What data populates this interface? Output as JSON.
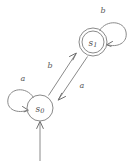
{
  "diagram": {
    "type": "finite-state-automaton",
    "title": "",
    "background_color": "#ffffff",
    "stroke_color": "#8a8a8a",
    "text_color": "#4a4a4a",
    "alphabet": [
      "a",
      "b"
    ],
    "states": [
      {
        "id": "s0",
        "label_base": "s",
        "label_sub": "0",
        "accepting": false,
        "initial": true,
        "cx": 40,
        "cy": 108,
        "r": 13
      },
      {
        "id": "s1",
        "label_base": "s",
        "label_sub": "1",
        "accepting": true,
        "initial": false,
        "cx": 93,
        "cy": 42,
        "r_outer": 14,
        "r_inner": 11
      }
    ],
    "transitions": [
      {
        "id": "t-s0-self",
        "from": "s0",
        "to": "s0",
        "symbol": "a",
        "kind": "self-loop",
        "label_x": 23,
        "label_y": 78
      },
      {
        "id": "t-s0-s1",
        "from": "s0",
        "to": "s1",
        "symbol": "b",
        "kind": "edge",
        "label_x": 50,
        "label_y": 65
      },
      {
        "id": "t-s1-s0",
        "from": "s1",
        "to": "s0",
        "symbol": "a",
        "kind": "edge",
        "label_x": 82,
        "label_y": 85
      },
      {
        "id": "t-s1-self",
        "from": "s1",
        "to": "s1",
        "symbol": "b",
        "kind": "self-loop",
        "label_x": 103,
        "label_y": 10
      }
    ],
    "start_arrow": {
      "id": "start-arrow",
      "target": "s0",
      "from_x": 40,
      "from_y": 161,
      "to_x": 40,
      "to_y": 122
    }
  }
}
